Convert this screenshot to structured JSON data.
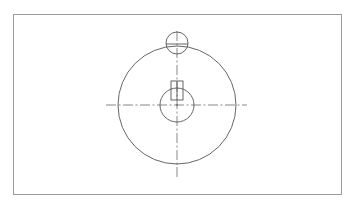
{
  "drawing": {
    "type": "technical-drawing",
    "frame": {
      "x": 13,
      "y": 14,
      "width": 329,
      "height": 181,
      "color": "#9a9a9a"
    },
    "line_color": "#555555",
    "centerline_color": "#6a6a6a",
    "shapes": {
      "outer_circle": {
        "cx": 177,
        "cy": 105,
        "r": 59
      },
      "hub_circle": {
        "cx": 177,
        "cy": 105,
        "r": 17
      },
      "top_circle": {
        "cx": 177,
        "cy": 43,
        "r": 11
      },
      "keyway_rect": {
        "x": 171,
        "y": 81,
        "width": 12,
        "height": 19
      }
    },
    "centerlines": {
      "horizontal": {
        "x1": 106,
        "y1": 105,
        "x2": 247,
        "y2": 105
      },
      "vertical": {
        "x1": 177,
        "y1": 31,
        "x2": 177,
        "y2": 178
      },
      "top_circle_horizontal": {
        "x1": 166,
        "y1": 43,
        "x2": 188,
        "y2": 43
      }
    }
  }
}
